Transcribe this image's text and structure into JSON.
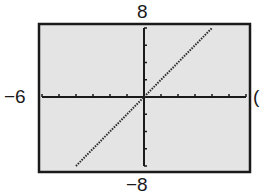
{
  "chart_data": {
    "type": "line",
    "title": "",
    "xlabel": "",
    "ylabel": "",
    "window": {
      "xmin": -6,
      "xmax": 6,
      "xscl": 1,
      "ymin": -8,
      "ymax": 8,
      "yscl": 2
    },
    "xlim": [
      -6,
      6
    ],
    "ylim": [
      -8,
      8
    ],
    "grid": false,
    "series": [
      {
        "name": "y = 2x",
        "style": "dotted",
        "x": [
          -4,
          -2,
          0,
          2,
          4
        ],
        "values": [
          -8,
          -4,
          0,
          4,
          8
        ]
      }
    ],
    "tick_labels": {
      "ymax": "8",
      "xmin": "−6",
      "ymin": "−8",
      "xmax": "6"
    }
  },
  "labels": {
    "ymax": "8",
    "xmin": "−6",
    "ymin": "−8",
    "xmax": "("
  },
  "colors": {
    "screen_bg": "#e4e4e4",
    "frame": "#1a1a1a",
    "axis": "#1a1a1a",
    "plot_line": "#2a2a2a"
  }
}
